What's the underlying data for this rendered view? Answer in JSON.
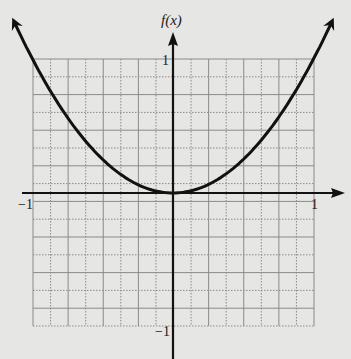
{
  "chart_data": {
    "type": "line",
    "title": "",
    "xlabel": "x",
    "ylabel": "f(x)",
    "xlim": [
      -1,
      1
    ],
    "ylim": [
      -1,
      1
    ],
    "grid": true,
    "grid_divisions_x": 16,
    "grid_divisions_y": 15,
    "x_tick_labels": [
      "-1",
      "1"
    ],
    "y_tick_labels": [
      "1",
      "-1"
    ],
    "series": [
      {
        "name": "f(x) = x^2",
        "x": [
          -1.15,
          -1.0,
          -0.75,
          -0.5,
          -0.25,
          0,
          0.25,
          0.5,
          0.75,
          1.0,
          1.15
        ],
        "values": [
          1.32,
          1.0,
          0.5625,
          0.25,
          0.0625,
          0,
          0.0625,
          0.25,
          0.5625,
          1.0,
          1.32
        ]
      }
    ],
    "arrows_on_curve_ends": true,
    "legend": null
  },
  "labels": {
    "y_axis": "f(x)",
    "x_min": "−1",
    "x_max": "1",
    "y_max": "1",
    "y_min": "−1"
  },
  "colors": {
    "background": "#e6e6e4",
    "grid": "#8a8a8a",
    "axis": "#111111",
    "curve": "#111111"
  }
}
